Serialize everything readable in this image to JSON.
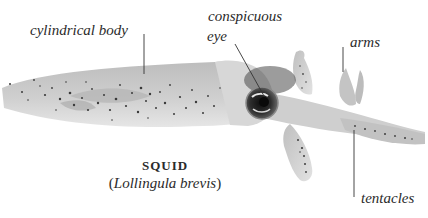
{
  "figure": {
    "subject": "squid",
    "colors": {
      "background": "#ffffff",
      "body": "#c9c9c9",
      "body_shadow": "#a8a8a8",
      "spots": "#3a3a3a",
      "eye_dark": "#1e1e1e",
      "leader_line": "#333333",
      "text": "#2b2b2b"
    }
  },
  "labels": {
    "body": "cylindrical body",
    "eye_line1": "conspicuous",
    "eye_line2": "eye",
    "arms": "arms",
    "tentacles": "tentacles"
  },
  "caption": {
    "common_name": "SQUID",
    "open_paren": "(",
    "scientific_name": "Lollingula brevis",
    "close_paren": ")"
  }
}
